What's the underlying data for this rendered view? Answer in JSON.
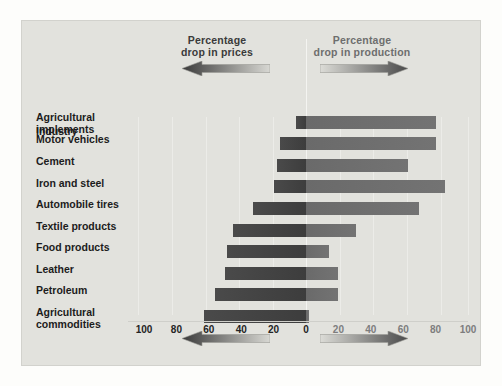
{
  "legend": {
    "left": {
      "title": "Percentage\ndrop in prices",
      "line1": "Percentage",
      "line2": "drop in prices",
      "arrow_icon": "arrow-left-gradient",
      "color": "#3d3d3d"
    },
    "right": {
      "title": "Percentage\ndrop in production",
      "line1": "Percentage",
      "line2": "drop in production",
      "arrow_icon": "arrow-right-gradient",
      "color": "#7d7d7d"
    }
  },
  "header": {
    "industry_label": "Industry"
  },
  "axis": {
    "left_ticks": [
      "100",
      "80",
      "60",
      "40",
      "20"
    ],
    "zero_tick": "0",
    "right_ticks": [
      "20",
      "40",
      "60",
      "80",
      "100"
    ]
  },
  "chart_data": {
    "type": "bar",
    "orientation": "horizontal-diverging",
    "title": "",
    "xlabel": "",
    "ylabel": "Industry",
    "categories": [
      "Agricultural\nimplements",
      "Motor vehicles",
      "Cement",
      "Iron and steel",
      "Automobile tires",
      "Textile products",
      "Food products",
      "Leather",
      "Petroleum",
      "Agricultural\ncommodities"
    ],
    "series": [
      {
        "name": "Percentage drop in prices",
        "direction": "left",
        "color": "#3d3d3d",
        "values": [
          6,
          16,
          18,
          20,
          33,
          45,
          49,
          50,
          56,
          63
        ]
      },
      {
        "name": "Percentage drop in production",
        "direction": "right",
        "color": "#737373",
        "values": [
          80,
          80,
          63,
          86,
          70,
          31,
          14,
          20,
          20,
          2
        ]
      }
    ],
    "xlim": [
      -100,
      100
    ],
    "xticks": [
      -100,
      -80,
      -60,
      -40,
      -20,
      0,
      20,
      40,
      60,
      80,
      100
    ],
    "grid": true,
    "legend_position": "top"
  }
}
